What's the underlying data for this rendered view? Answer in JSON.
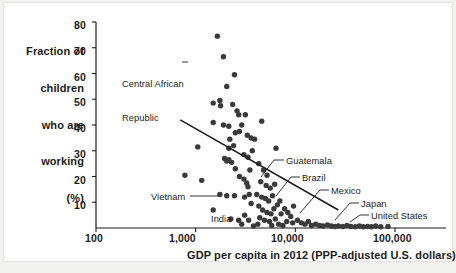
{
  "figure": {
    "background": "#f2f2f0",
    "plate_color": "#ffffff",
    "ink_color": "#1b1b1b",
    "dot_color": "#3a3a3a"
  },
  "axes": {
    "y_title_lines": [
      "Fraction of",
      "children",
      "who are",
      "working",
      "(%)"
    ],
    "y_ticks": [
      "80",
      "70",
      "60",
      "50",
      "40",
      "30",
      "20",
      "10"
    ],
    "x_ticks": [
      "100",
      "1,000",
      "10,000",
      "100,000"
    ],
    "x_title": "GDP per capita in 2012 (PPP-adjusted U.S. dollars)"
  },
  "annotations": [
    {
      "name": "central-african-republic",
      "label_lines": [
        "Central African",
        "Republic"
      ]
    },
    {
      "name": "vietnam",
      "label": "Vietnam"
    },
    {
      "name": "india",
      "label": "India"
    },
    {
      "name": "guatemala",
      "label": "Guatemala"
    },
    {
      "name": "brazil",
      "label": "Brazil"
    },
    {
      "name": "mexico",
      "label": "Mexico"
    },
    {
      "name": "japan",
      "label": "Japan"
    },
    {
      "name": "united-states",
      "label": "United States"
    }
  ],
  "chart_data": {
    "type": "scatter",
    "title": "",
    "xlabel": "GDP per capita in 2012 (PPP-adjusted U.S. dollars)",
    "ylabel": "Fraction of children who are working (%)",
    "xscale": "log",
    "yscale": "linear",
    "xlim": [
      100,
      200000
    ],
    "ylim": [
      0,
      84
    ],
    "xticks": [
      100,
      1000,
      10000,
      100000
    ],
    "xticklabels": [
      "100",
      "1,000",
      "10,000",
      "100,000"
    ],
    "yticks": [
      10,
      20,
      30,
      40,
      50,
      60,
      70,
      80
    ],
    "yticklabels": [
      "10",
      "20",
      "30",
      "40",
      "50",
      "60",
      "70",
      "80"
    ],
    "grid": false,
    "legend": null,
    "marker": {
      "shape": "circle",
      "color": "#3a3a3a",
      "size_px": 5.4
    },
    "trendline": {
      "type": "linear-on-log-x",
      "x_start": 700,
      "y_start": 42,
      "x_end": 27000,
      "y_end": 7
    },
    "points": [
      {
        "x": 1650,
        "y": 74.5
      },
      {
        "x": 1900,
        "y": 66.5,
        "label": "Central African Republic"
      },
      {
        "x": 2450,
        "y": 59.5
      },
      {
        "x": 2050,
        "y": 55.0
      },
      {
        "x": 1500,
        "y": 48.5
      },
      {
        "x": 1750,
        "y": 49.5
      },
      {
        "x": 1780,
        "y": 47.5
      },
      {
        "x": 2350,
        "y": 48.0
      },
      {
        "x": 2600,
        "y": 45.5
      },
      {
        "x": 2700,
        "y": 44.0
      },
      {
        "x": 1500,
        "y": 41.0
      },
      {
        "x": 1900,
        "y": 40.0
      },
      {
        "x": 2150,
        "y": 39.5
      },
      {
        "x": 2500,
        "y": 37.0
      },
      {
        "x": 2750,
        "y": 37.5
      },
      {
        "x": 2900,
        "y": 40.0
      },
      {
        "x": 1050,
        "y": 31.5
      },
      {
        "x": 2200,
        "y": 34.5
      },
      {
        "x": 2400,
        "y": 32.0
      },
      {
        "x": 2150,
        "y": 31.0
      },
      {
        "x": 3300,
        "y": 36.0
      },
      {
        "x": 3600,
        "y": 35.0
      },
      {
        "x": 3900,
        "y": 34.5
      },
      {
        "x": 4600,
        "y": 41.5
      },
      {
        "x": 1950,
        "y": 27.0
      },
      {
        "x": 2050,
        "y": 26.0
      },
      {
        "x": 2150,
        "y": 26.5
      },
      {
        "x": 2300,
        "y": 25.5
      },
      {
        "x": 2500,
        "y": 23.0
      },
      {
        "x": 3050,
        "y": 28.5
      },
      {
        "x": 3350,
        "y": 27.5
      },
      {
        "x": 780,
        "y": 20.5
      },
      {
        "x": 1150,
        "y": 18.5
      },
      {
        "x": 2750,
        "y": 20.0
      },
      {
        "x": 3050,
        "y": 19.0
      },
      {
        "x": 3250,
        "y": 17.5
      },
      {
        "x": 3350,
        "y": 16.0
      },
      {
        "x": 1750,
        "y": 13.0
      },
      {
        "x": 2050,
        "y": 12.5
      },
      {
        "x": 2450,
        "y": 12.5,
        "label": "Vietnam"
      },
      {
        "x": 3100,
        "y": 12.0
      },
      {
        "x": 3450,
        "y": 13.0
      },
      {
        "x": 3600,
        "y": 9.5
      },
      {
        "x": 1500,
        "y": 7.0
      },
      {
        "x": 2250,
        "y": 3.5
      },
      {
        "x": 2700,
        "y": 3.0,
        "label": "India"
      },
      {
        "x": 3100,
        "y": 5.0
      },
      {
        "x": 3400,
        "y": 3.0
      },
      {
        "x": 4300,
        "y": 25.0
      },
      {
        "x": 4800,
        "y": 22.5
      },
      {
        "x": 5200,
        "y": 20.5
      },
      {
        "x": 4500,
        "y": 18.0
      },
      {
        "x": 5100,
        "y": 16.5
      },
      {
        "x": 5600,
        "y": 15.5
      },
      {
        "x": 6200,
        "y": 17.0
      },
      {
        "x": 4100,
        "y": 13.0
      },
      {
        "x": 4600,
        "y": 12.0
      },
      {
        "x": 5000,
        "y": 11.5
      },
      {
        "x": 5400,
        "y": 10.5
      },
      {
        "x": 5900,
        "y": 12.5,
        "label": "Guatemala"
      },
      {
        "x": 4300,
        "y": 8.5
      },
      {
        "x": 4700,
        "y": 7.0
      },
      {
        "x": 5200,
        "y": 6.0
      },
      {
        "x": 5700,
        "y": 5.5
      },
      {
        "x": 6100,
        "y": 7.5
      },
      {
        "x": 6600,
        "y": 9.0
      },
      {
        "x": 7000,
        "y": 10.5
      },
      {
        "x": 4400,
        "y": 4.0
      },
      {
        "x": 4900,
        "y": 3.0
      },
      {
        "x": 5500,
        "y": 2.5
      },
      {
        "x": 6300,
        "y": 3.5
      },
      {
        "x": 7200,
        "y": 5.5
      },
      {
        "x": 7800,
        "y": 7.5
      },
      {
        "x": 8400,
        "y": 6.0
      },
      {
        "x": 9000,
        "y": 4.5
      },
      {
        "x": 9600,
        "y": 8.5,
        "label": "Brazil"
      },
      {
        "x": 8200,
        "y": 2.5
      },
      {
        "x": 9400,
        "y": 2.0
      },
      {
        "x": 10500,
        "y": 3.0
      },
      {
        "x": 11500,
        "y": 2.0
      },
      {
        "x": 12500,
        "y": 1.5
      },
      {
        "x": 13500,
        "y": 2.5
      },
      {
        "x": 14500,
        "y": 1.0
      },
      {
        "x": 16000,
        "y": 1.5
      },
      {
        "x": 17500,
        "y": 1.0
      },
      {
        "x": 19000,
        "y": 0.8
      },
      {
        "x": 21000,
        "y": 1.2
      },
      {
        "x": 23000,
        "y": 0.8,
        "label": "Mexico"
      },
      {
        "x": 25000,
        "y": 0.6
      },
      {
        "x": 27000,
        "y": 0.8
      },
      {
        "x": 30000,
        "y": 0.6
      },
      {
        "x": 33000,
        "y": 1.0
      },
      {
        "x": 36000,
        "y": 0.6
      },
      {
        "x": 40000,
        "y": 0.5
      },
      {
        "x": 44000,
        "y": 0.8
      },
      {
        "x": 48000,
        "y": 0.5,
        "label": "Japan"
      },
      {
        "x": 53000,
        "y": 0.6
      },
      {
        "x": 58000,
        "y": 0.5
      },
      {
        "x": 64000,
        "y": 0.8
      },
      {
        "x": 72000,
        "y": 0.5
      },
      {
        "x": 85000,
        "y": 0.6,
        "label": "United States"
      },
      {
        "x": 3800,
        "y": 0.8
      },
      {
        "x": 4200,
        "y": 1.5
      },
      {
        "x": 5800,
        "y": 1.0
      },
      {
        "x": 6800,
        "y": 1.5
      },
      {
        "x": 7500,
        "y": 1.0
      },
      {
        "x": 2900,
        "y": 1.5
      },
      {
        "x": 3500,
        "y": 22.5
      },
      {
        "x": 3700,
        "y": 30.0
      },
      {
        "x": 6400,
        "y": 31.0
      },
      {
        "x": 3150,
        "y": 44.0
      }
    ]
  }
}
